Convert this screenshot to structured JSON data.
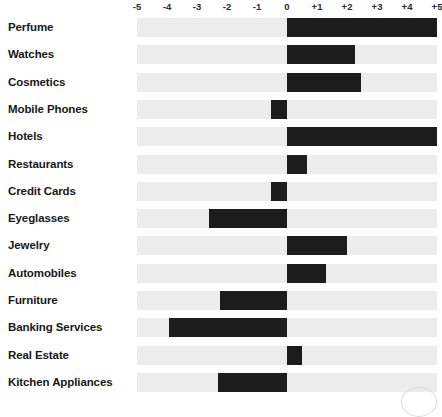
{
  "chart_data": {
    "type": "bar",
    "orientation": "horizontal",
    "title": "",
    "subtitle": "",
    "xlabel": "",
    "ylabel": "",
    "xlim": [
      -5,
      5
    ],
    "grid": false,
    "legend": null,
    "axis_position": "top",
    "zero_baseline": 0,
    "tick_labels": [
      "-5",
      "-4",
      "-3",
      "-2",
      "-1",
      "0",
      "+1",
      "+2",
      "+3",
      "+4",
      "+5"
    ],
    "tick_values": [
      -5,
      -4,
      -3,
      -2,
      -1,
      0,
      1,
      2,
      3,
      4,
      5
    ],
    "categories": [
      "Perfume",
      "Watches",
      "Cosmetics",
      "Mobile Phones",
      "Hotels",
      "Restaurants",
      "Credit Cards",
      "Eyeglasses",
      "Jewelry",
      "Automobiles",
      "Furniture",
      "Banking Services",
      "Real Estate",
      "Kitchen Appliances"
    ],
    "values": [
      5.0,
      2.25,
      2.45,
      -0.55,
      5.0,
      0.65,
      -0.55,
      -2.6,
      2.0,
      1.3,
      -2.25,
      -3.95,
      0.5,
      -2.3
    ],
    "colors": {
      "bar": "#1c1c1c",
      "track": "#ececec",
      "background": "#ffffff",
      "label_text": "#181818",
      "tick_text": "#2b2b2b"
    }
  }
}
